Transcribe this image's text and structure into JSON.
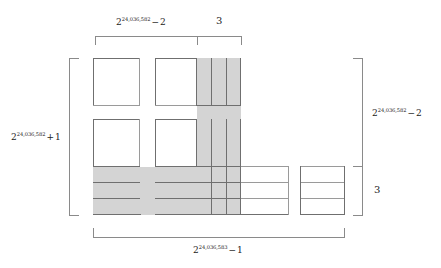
{
  "figure": {
    "type": "geometric-partition-diagram",
    "exponent_a": "24,036,582",
    "exponent_b": "24,036,583",
    "labels": {
      "top_left": {
        "base": "2",
        "exponent": "24,036,582",
        "operator": "−",
        "term": "2"
      },
      "top_right": {
        "text": "3"
      },
      "left": {
        "base": "2",
        "exponent": "24,036,582",
        "operator": "+",
        "term": "1"
      },
      "right_upper": {
        "base": "2",
        "exponent": "24,036,582",
        "operator": "−",
        "term": "2"
      },
      "right_lower": {
        "text": "3"
      },
      "bottom": {
        "base": "2",
        "exponent": "24,036,583",
        "operator": "−",
        "term": "1"
      }
    },
    "colors": {
      "shade": "#d4d4d4",
      "stroke_strong": "#6f6f6f",
      "stroke_thin": "#9a9a9a",
      "bracket": "#8a8a8a",
      "background": "#ffffff",
      "text": "#222222"
    },
    "counts": {
      "narrow_shaded_columns": 3,
      "shaded_bottom_rows": 3,
      "right_block_rows": 3
    }
  }
}
